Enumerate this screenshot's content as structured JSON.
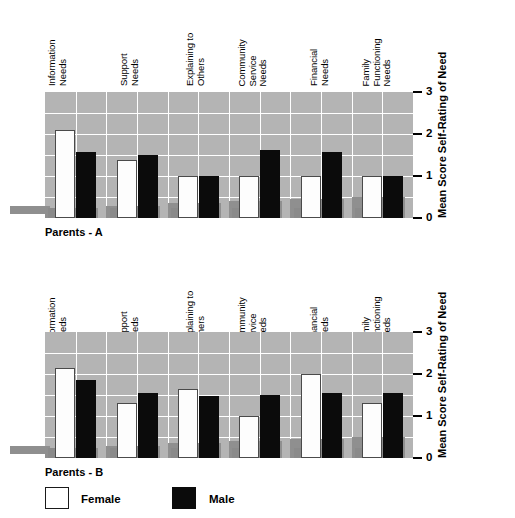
{
  "chart_data": [
    {
      "type": "bar",
      "title": "Parents - A",
      "xlabel": "",
      "ylabel": "Mean Score\nSelf-Rating of Need",
      "ylabel_lines": [
        "Mean Score",
        "Self-Rating of Need"
      ],
      "ylim": [
        0,
        3
      ],
      "yticks": [
        0,
        1,
        2,
        3
      ],
      "ytick_labels": [
        "0",
        "1",
        "2",
        "3"
      ],
      "grid": true,
      "legend_position": "bottom",
      "categories": [
        "Information Needs",
        "Support Needs",
        "Explaining to Others",
        "Community Service Needs",
        "Financial Needs",
        "Family Functioning Needs"
      ],
      "category_lines": [
        [
          "Information",
          "Needs"
        ],
        [
          "Support",
          "Needs"
        ],
        [
          "Explaining to",
          "Others"
        ],
        [
          "Community",
          "Service",
          "Needs"
        ],
        [
          "Financial",
          "Needs"
        ],
        [
          "Family",
          "Functioning",
          "Needs"
        ]
      ],
      "series": [
        {
          "name": "Female",
          "color": "#ffffff",
          "values": [
            2.1,
            1.37,
            1.0,
            1.0,
            1.0,
            1.0
          ]
        },
        {
          "name": "Male",
          "color": "#000000",
          "values": [
            1.58,
            1.5,
            1.0,
            1.63,
            1.56,
            1.0
          ]
        }
      ]
    },
    {
      "type": "bar",
      "title": "Parents - B",
      "xlabel": "",
      "ylabel": "Mean Score\nSelf-Rating of Need",
      "ylabel_lines": [
        "Mean Score",
        "Self-Rating of Need"
      ],
      "ylim": [
        0,
        3
      ],
      "yticks": [
        0,
        1,
        2,
        3
      ],
      "ytick_labels": [
        "0",
        "1",
        "2",
        "3"
      ],
      "grid": true,
      "legend_position": "bottom",
      "categories": [
        "Information Needs",
        "Support Needs",
        "Explaining to Others",
        "Community Service Needs",
        "Financial Needs",
        "Family Functioning Needs"
      ],
      "category_lines": [
        [
          "Information",
          "Needs"
        ],
        [
          "Support",
          "Needs"
        ],
        [
          "Explaining to",
          "Others"
        ],
        [
          "Community",
          "Service",
          "Needs"
        ],
        [
          "Financial",
          "Needs"
        ],
        [
          "Family",
          "Functioning",
          "Needs"
        ]
      ],
      "series": [
        {
          "name": "Female",
          "color": "#ffffff",
          "values": [
            2.15,
            1.3,
            1.65,
            1.0,
            2.0,
            1.3
          ]
        },
        {
          "name": "Male",
          "color": "#000000",
          "values": [
            1.85,
            1.55,
            1.48,
            1.5,
            1.55,
            1.55
          ]
        }
      ]
    }
  ],
  "legend": {
    "entries": [
      {
        "label": "Female",
        "color": "#ffffff"
      },
      {
        "label": "Male",
        "color": "#000000"
      }
    ]
  },
  "colors": {
    "plot_background": "#b4b4b4",
    "gridline": "#ffffff",
    "female_bar": "#ffffff",
    "male_bar": "#000000",
    "shadow": "#8a8a8a",
    "text": "#000000"
  }
}
